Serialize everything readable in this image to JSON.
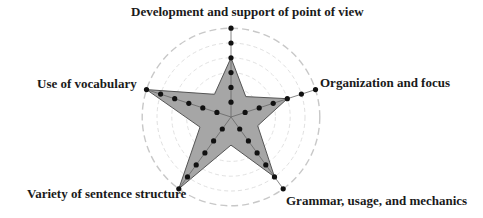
{
  "chart_data": {
    "type": "radar",
    "title": "",
    "categories": [
      "Development and support of point of view",
      "Organization and focus",
      "Grammar, usage, and mechanics",
      "Variety of sentence structure",
      "Use of vocabulary"
    ],
    "series": [
      {
        "name": "Score",
        "values": [
          4,
          4,
          5,
          6,
          6
        ]
      }
    ],
    "scale": {
      "min": 0,
      "max": 6,
      "ticks": [
        1,
        2,
        3,
        4,
        5,
        6
      ]
    },
    "grid": "dashed concentric circles",
    "legend": "none",
    "colors": {
      "fill": "#a6a6a6",
      "stroke": "#555555",
      "dots": "#111111",
      "grid": "#cfcfcf"
    }
  },
  "labels": {
    "top": "Development and support of point of view",
    "right": "Organization and focus",
    "bottom_right": "Grammar, usage, and mechanics",
    "bottom_left": "Variety of sentence structure",
    "left": "Use of vocabulary"
  }
}
